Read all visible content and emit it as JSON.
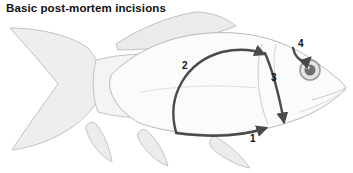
{
  "figure": {
    "title": "Basic post-mortem incisions",
    "background_color": "#ffffff"
  },
  "colors": {
    "title_text": "#111111",
    "body_fill": "#fbfbfb",
    "body_outline": "#b9b9b9",
    "fin_fill": "#eeeeee",
    "fin_outline": "#c2c2c2",
    "incision_arrow": "#4a4a4a",
    "eye_ring": "#9a9a9a",
    "eye_pupil": "#6f6f6f",
    "eye_highlight": "#ffffff"
  },
  "incisions": [
    {
      "number": "1",
      "name": "ventral-midline-incision",
      "description": "Incision along the ventral belly line running from the vent forward to the isthmus",
      "label_x": 250,
      "label_y": 133
    },
    {
      "number": "2",
      "name": "dorsal-flank-arc-incision",
      "description": "Large curved incision arcing up over the flank from the vent to behind the operculum",
      "label_x": 182,
      "label_y": 60
    },
    {
      "number": "3",
      "name": "opercular-vertical-incision",
      "description": "Vertical incision running down behind the gill cover",
      "label_x": 271,
      "label_y": 72
    },
    {
      "number": "4",
      "name": "periocular-hook-incision",
      "description": "Short hooked incision above and around the eye",
      "label_x": 298,
      "label_y": 38
    }
  ],
  "anatomy": [
    {
      "name": "caudal-fin",
      "label": "Caudal fin"
    },
    {
      "name": "caudal-peduncle",
      "label": "Caudal peduncle"
    },
    {
      "name": "dorsal-fin",
      "label": "Dorsal fin"
    },
    {
      "name": "anal-fin",
      "label": "Anal fin"
    },
    {
      "name": "pelvic-fin",
      "label": "Pelvic fin"
    },
    {
      "name": "pectoral-fin",
      "label": "Pectoral fin"
    },
    {
      "name": "operculum",
      "label": "Operculum"
    },
    {
      "name": "eye",
      "label": "Eye"
    },
    {
      "name": "mouth",
      "label": "Mouth"
    }
  ]
}
